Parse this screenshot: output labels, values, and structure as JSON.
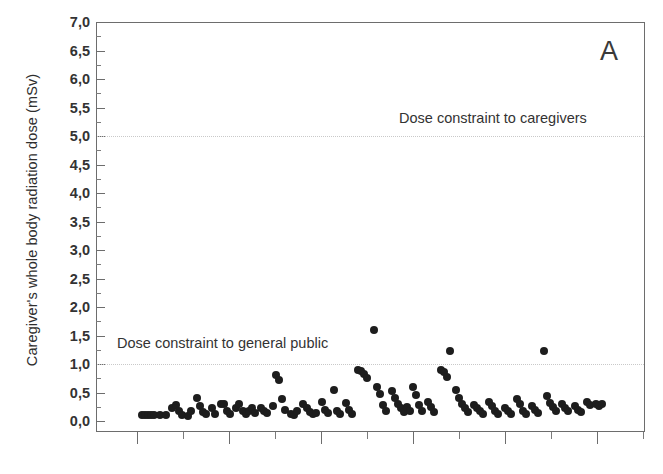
{
  "figure": {
    "panel_label": "A",
    "ylabel": "Caregiver's whole body radiation dose (mSv)"
  },
  "annotations": {
    "caregivers": "Dose constraint to caregivers",
    "general_public": "Dose constraint to general public"
  },
  "chart_data": {
    "type": "scatter",
    "title": "",
    "panel": "A",
    "xlabel": "",
    "ylabel": "Caregiver's whole body radiation dose (mSv)",
    "ylim": [
      0.0,
      7.0
    ],
    "ytick_labels": [
      "0,0",
      "0,5",
      "1,0",
      "1,5",
      "2,0",
      "2,5",
      "3,0",
      "3,5",
      "4,0",
      "4,5",
      "5,0",
      "5,5",
      "6,0",
      "6,5",
      "7,0"
    ],
    "ytick_values": [
      0.0,
      0.5,
      1.0,
      1.5,
      2.0,
      2.5,
      3.0,
      3.5,
      4.0,
      4.5,
      5.0,
      5.5,
      6.0,
      6.5,
      7.0
    ],
    "yminor_step": 0.25,
    "xtick_labels": [],
    "x_axis_shows_labels": false,
    "xtick_count_major": 6,
    "xtick_count_minor": 6,
    "grid": false,
    "legend": null,
    "decimal_separator": ",",
    "marker": {
      "shape": "circle",
      "color": "#1d1d1d",
      "size_px": 8
    },
    "reference_lines": [
      {
        "label": "Dose constraint to caregivers",
        "y": 5.0,
        "style": "dotted",
        "color": "#c9c9c9"
      },
      {
        "label": "Dose constraint to general public",
        "y": 1.0,
        "style": "dotted",
        "color": "#c9c9c9"
      }
    ],
    "units": "mSv",
    "n_points": 122,
    "points": [
      [
        1,
        0.1
      ],
      [
        2,
        0.1
      ],
      [
        3,
        0.1
      ],
      [
        4,
        0.1
      ],
      [
        5,
        0.11
      ],
      [
        7,
        0.1
      ],
      [
        9,
        0.11
      ],
      [
        11,
        0.22
      ],
      [
        12,
        0.28
      ],
      [
        13,
        0.17
      ],
      [
        14,
        0.1
      ],
      [
        16,
        0.09
      ],
      [
        17,
        0.18
      ],
      [
        19,
        0.4
      ],
      [
        20,
        0.26
      ],
      [
        21,
        0.16
      ],
      [
        22,
        0.12
      ],
      [
        24,
        0.22
      ],
      [
        25,
        0.12
      ],
      [
        27,
        0.3
      ],
      [
        28,
        0.3
      ],
      [
        29,
        0.17
      ],
      [
        30,
        0.12
      ],
      [
        32,
        0.22
      ],
      [
        33,
        0.3
      ],
      [
        34,
        0.17
      ],
      [
        35,
        0.12
      ],
      [
        36,
        0.18
      ],
      [
        37,
        0.22
      ],
      [
        38,
        0.14
      ],
      [
        40,
        0.22
      ],
      [
        41,
        0.18
      ],
      [
        42,
        0.14
      ],
      [
        44,
        0.27
      ],
      [
        45,
        0.8
      ],
      [
        46,
        0.72
      ],
      [
        47,
        0.38
      ],
      [
        48,
        0.2
      ],
      [
        50,
        0.12
      ],
      [
        51,
        0.1
      ],
      [
        52,
        0.18
      ],
      [
        54,
        0.3
      ],
      [
        55,
        0.22
      ],
      [
        56,
        0.16
      ],
      [
        57,
        0.12
      ],
      [
        58,
        0.14
      ],
      [
        60,
        0.33
      ],
      [
        61,
        0.2
      ],
      [
        62,
        0.14
      ],
      [
        64,
        0.55
      ],
      [
        65,
        0.18
      ],
      [
        66,
        0.12
      ],
      [
        68,
        0.32
      ],
      [
        69,
        0.2
      ],
      [
        70,
        0.13
      ],
      [
        72,
        0.9
      ],
      [
        73,
        0.88
      ],
      [
        74,
        0.82
      ],
      [
        75,
        0.76
      ],
      [
        77,
        1.6
      ],
      [
        78,
        0.6
      ],
      [
        79,
        0.47
      ],
      [
        80,
        0.28
      ],
      [
        81,
        0.17
      ],
      [
        83,
        0.52
      ],
      [
        84,
        0.4
      ],
      [
        85,
        0.3
      ],
      [
        86,
        0.22
      ],
      [
        87,
        0.16
      ],
      [
        88,
        0.24
      ],
      [
        89,
        0.18
      ],
      [
        90,
        0.6
      ],
      [
        91,
        0.45
      ],
      [
        92,
        0.28
      ],
      [
        93,
        0.18
      ],
      [
        95,
        0.33
      ],
      [
        96,
        0.25
      ],
      [
        97,
        0.16
      ],
      [
        99,
        0.9
      ],
      [
        100,
        0.86
      ],
      [
        101,
        0.78
      ],
      [
        102,
        1.22
      ],
      [
        104,
        0.55
      ],
      [
        105,
        0.4
      ],
      [
        106,
        0.3
      ],
      [
        107,
        0.22
      ],
      [
        108,
        0.16
      ],
      [
        110,
        0.28
      ],
      [
        111,
        0.22
      ],
      [
        112,
        0.17
      ],
      [
        113,
        0.12
      ],
      [
        115,
        0.33
      ],
      [
        116,
        0.26
      ],
      [
        117,
        0.18
      ],
      [
        118,
        0.12
      ],
      [
        120,
        0.22
      ],
      [
        121,
        0.18
      ],
      [
        122,
        0.12
      ],
      [
        124,
        0.38
      ],
      [
        125,
        0.3
      ],
      [
        126,
        0.18
      ],
      [
        127,
        0.12
      ],
      [
        129,
        0.26
      ],
      [
        130,
        0.2
      ],
      [
        131,
        0.14
      ],
      [
        133,
        1.22
      ],
      [
        134,
        0.44
      ],
      [
        135,
        0.32
      ],
      [
        136,
        0.24
      ],
      [
        137,
        0.18
      ],
      [
        139,
        0.3
      ],
      [
        140,
        0.22
      ],
      [
        141,
        0.17
      ],
      [
        143,
        0.26
      ],
      [
        144,
        0.2
      ],
      [
        145,
        0.15
      ],
      [
        147,
        0.34
      ],
      [
        148,
        0.28
      ],
      [
        150,
        0.3
      ],
      [
        151,
        0.26
      ],
      [
        152,
        0.3
      ]
    ],
    "x_range_px": [
      142,
      602
    ],
    "note": "x-axis is an unlabelled patient/measurement index"
  }
}
